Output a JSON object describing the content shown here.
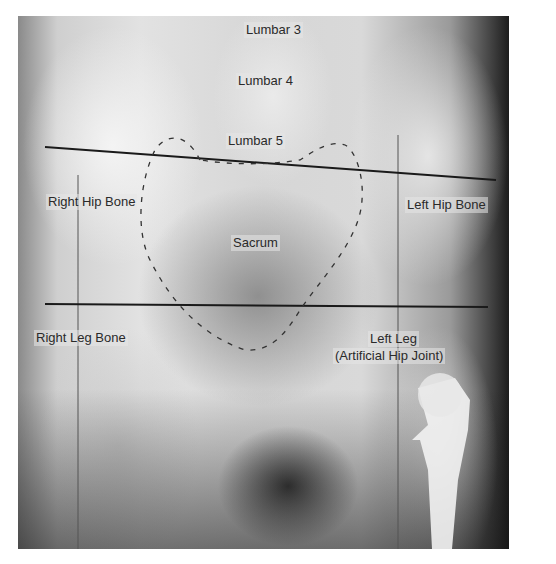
{
  "image": {
    "subject": "Pelvis X-ray (anteroposterior view)",
    "labels": {
      "lumbar3": "Lumbar 3",
      "lumbar4": "Lumbar 4",
      "lumbar5": "Lumbar 5",
      "right_hip_bone": "Right Hip Bone",
      "left_hip_bone": "Left Hip Bone",
      "sacrum": "Sacrum",
      "right_leg_bone": "Right Leg Bone",
      "left_leg_line1": "Left Leg",
      "left_leg_line2": "(Artificial Hip Joint)"
    },
    "annotations": {
      "upper_line": {
        "x1": 45,
        "y1": 147,
        "x2": 496,
        "y2": 180,
        "color": "#1a1a1a"
      },
      "lower_line": {
        "x1": 45,
        "y1": 304,
        "x2": 488,
        "y2": 307,
        "color": "#1a1a1a"
      },
      "vertical_left": {
        "x": 78,
        "y1": 175,
        "y2": 549
      },
      "vertical_right": {
        "x": 398,
        "y1": 135,
        "y2": 549
      },
      "sacrum_outline": "dashed",
      "colors": {
        "line": "#1a1a1a",
        "label_text": "#2a2a2a",
        "border": "#ffffff"
      }
    }
  }
}
